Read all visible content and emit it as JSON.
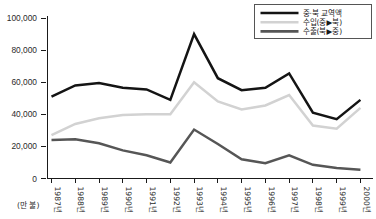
{
  "chart_data": {
    "type": "line",
    "title": "",
    "xlabel": "",
    "ylabel": "",
    "unit_label": "(만 불)",
    "ylim": [
      0,
      100000
    ],
    "yticks": [
      0,
      20000,
      40000,
      60000,
      80000,
      100000
    ],
    "ytick_labels": [
      "0",
      "20,000",
      "40,000",
      "60,000",
      "80,000",
      "100,000"
    ],
    "grid": false,
    "legend_position": "top-right",
    "categories": [
      "1987년",
      "1988년",
      "1989년",
      "1990년",
      "1991년",
      "1992년",
      "1993년",
      "1994년",
      "1995년",
      "1996년",
      "1997년",
      "1998년",
      "1999년",
      "2000년"
    ],
    "series": [
      {
        "name": "중·북 교역액",
        "color": "#141414",
        "width": 2.5,
        "values": [
          51000,
          58000,
          59500,
          56500,
          55500,
          49000,
          90000,
          62500,
          55000,
          56500,
          65500,
          41000,
          37000,
          49000
        ]
      },
      {
        "name": "수입(중▶북)",
        "color": "#d2d2d2",
        "width": 2.5,
        "values": [
          27000,
          34000,
          37500,
          39500,
          40000,
          40000,
          60000,
          48000,
          43000,
          45500,
          52000,
          33000,
          31000,
          44000
        ]
      },
      {
        "name": "수출(북▶중)",
        "color": "#565656",
        "width": 2.5,
        "values": [
          24000,
          24500,
          22000,
          17500,
          14500,
          10000,
          30500,
          21500,
          12000,
          9500,
          14500,
          8500,
          6500,
          5500
        ]
      }
    ]
  },
  "legend": {
    "items": [
      {
        "label": "중·북 교역액",
        "color": "#141414"
      },
      {
        "label": "수입(중▶북)",
        "color": "#d2d2d2"
      },
      {
        "label": "수출(북▶중)",
        "color": "#565656"
      }
    ]
  }
}
